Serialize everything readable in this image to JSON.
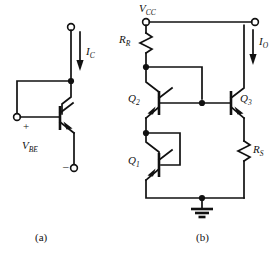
{
  "figure": {
    "background_color": "#ffffff",
    "line_color": "#111111"
  },
  "panel_a": {
    "caption": "(a)",
    "labels": {
      "collector_current": "I",
      "collector_current_sub": "C",
      "base_emitter_voltage": "V",
      "base_emitter_voltage_sub": "BE",
      "plus_sign": "+",
      "minus_sign": "–"
    },
    "components": [
      {
        "name": "npn-transistor",
        "label": ""
      },
      {
        "name": "top-terminal",
        "label": ""
      },
      {
        "name": "base-terminal",
        "label": ""
      },
      {
        "name": "emitter-terminal",
        "label": ""
      }
    ]
  },
  "panel_b": {
    "caption": "(b)",
    "labels": {
      "supply": "V",
      "supply_sub": "CC",
      "output_current": "I",
      "output_current_sub": "O",
      "resistor_ref": "R",
      "resistor_ref_sub": "R",
      "resistor_series": "R",
      "resistor_series_sub": "S",
      "q1": "Q",
      "q1_sub": "1",
      "q2": "Q",
      "q2_sub": "2",
      "q3": "Q",
      "q3_sub": "3"
    },
    "components": [
      {
        "name": "resistor-rr",
        "label": "R_R"
      },
      {
        "name": "resistor-rs",
        "label": "R_S"
      },
      {
        "name": "transistor-q1",
        "label": "Q_1"
      },
      {
        "name": "transistor-q2",
        "label": "Q_2"
      },
      {
        "name": "transistor-q3",
        "label": "Q_3"
      },
      {
        "name": "ground-symbol",
        "label": ""
      },
      {
        "name": "vcc-terminal",
        "label": "V_CC"
      },
      {
        "name": "output-terminal",
        "label": "I_O"
      }
    ]
  }
}
